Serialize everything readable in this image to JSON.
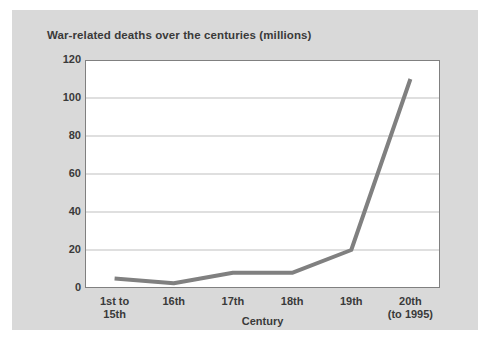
{
  "figure": {
    "background_color": "#ffffff",
    "panel_color": "#d9d9d9",
    "plot_background_color": "#ffffff"
  },
  "chart_data": {
    "type": "line",
    "title": "War-related deaths over the centuries (millions)",
    "xlabel": "Century",
    "ylabel": "",
    "categories": [
      "1st to\n15th",
      "16th",
      "17th",
      "18th",
      "19th",
      "20th\n(to 1995)"
    ],
    "values": [
      5,
      2.5,
      8,
      8,
      20,
      110
    ],
    "ylim": [
      0,
      120
    ],
    "yticks": [
      0,
      20,
      40,
      60,
      80,
      100,
      120
    ],
    "ytick_labels": [
      "0",
      "20",
      "40",
      "60",
      "80",
      "100",
      "120"
    ],
    "grid": "horizontal",
    "legend": "none",
    "line_color": "#808080",
    "line_width": 4,
    "grid_color": "#bfbfbf",
    "axis_color": "#808080"
  }
}
